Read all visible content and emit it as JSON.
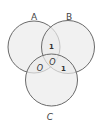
{
  "diagram": {
    "type": "venn-3",
    "colors": {
      "fill": "#ebebeb",
      "stroke": "#6a6a6a",
      "text": "#333333"
    },
    "sets": [
      {
        "id": "A",
        "label": "A"
      },
      {
        "id": "B",
        "label": "B"
      },
      {
        "id": "C",
        "label": "C"
      }
    ],
    "regions": {
      "A_and_B_only": "1",
      "A_and_C_only": "O",
      "A_and_B_and_C": "O",
      "B_and_C_only": "1"
    }
  }
}
